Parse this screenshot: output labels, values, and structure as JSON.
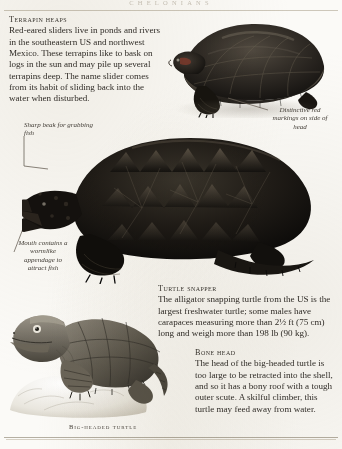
{
  "page": {
    "running_head": "Chelonians",
    "background_color": "#fbfaf7",
    "ink_color": "#322e29"
  },
  "sections": [
    {
      "id": "terrapin",
      "heading": "Terrapin heaps",
      "body": "Red-eared sliders live in ponds and rivers in the southeastern US and northwest Mexico. These terrapins like to bask on logs in the sun and may pile up several terrapins deep. The name slider comes from its habit of sliding back into the water when disturbed."
    },
    {
      "id": "snapper",
      "heading": "Turtle snapper",
      "body": "The alligator snapping turtle from the US is the largest freshwater turtle; some males have carapaces measuring more than 2½ ft (75 cm) long and weigh more than 198 lb (90 kg)."
    },
    {
      "id": "bonehead",
      "heading": "Bone head",
      "body": "The head of the big-headed turtle is too large to be retracted into the shell, and so it has a bony roof with a tough outer scute. A skilful climber, this turtle may feed away from water."
    }
  ],
  "annotations": [
    {
      "id": "red-markings",
      "text": "Distinctive red markings on side of head"
    },
    {
      "id": "sharp-beak",
      "text": "Sharp beak for grabbing fish"
    },
    {
      "id": "wormlike",
      "text": "Mouth contains a wormlike appendage to attract fish"
    }
  ],
  "captions": [
    {
      "id": "big-headed-turtle",
      "text": "Big-headed turtle"
    }
  ],
  "figures": [
    {
      "id": "red-eared-slider-photo",
      "kind": "photograph",
      "subject": "Red-eared slider turtle, side view"
    },
    {
      "id": "snapping-turtle-photo",
      "kind": "photograph",
      "subject": "Alligator snapping turtle, side view"
    },
    {
      "id": "big-headed-turtle-art",
      "kind": "illustration",
      "subject": "Big-headed turtle on rock"
    }
  ]
}
